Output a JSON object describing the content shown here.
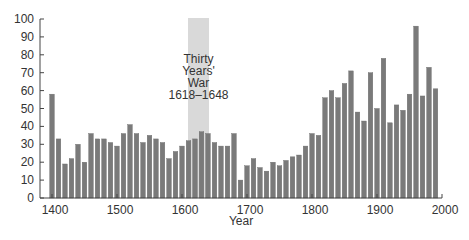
{
  "chart_data": {
    "type": "bar",
    "title": "",
    "xlabel": "Year",
    "ylabel": "",
    "ylim": [
      0,
      100
    ],
    "xlim": [
      1400,
      2000
    ],
    "grid": false,
    "legend": null,
    "y_ticks": [
      0,
      10,
      20,
      30,
      40,
      50,
      60,
      70,
      80,
      90,
      100
    ],
    "x_ticks": [
      1400,
      1500,
      1600,
      1700,
      1800,
      1900,
      2000
    ],
    "categories": [
      1400,
      1410,
      1420,
      1430,
      1440,
      1450,
      1460,
      1470,
      1480,
      1490,
      1500,
      1510,
      1520,
      1530,
      1540,
      1550,
      1560,
      1570,
      1580,
      1590,
      1600,
      1610,
      1620,
      1630,
      1640,
      1650,
      1660,
      1670,
      1680,
      1690,
      1700,
      1710,
      1720,
      1730,
      1740,
      1750,
      1760,
      1770,
      1780,
      1790,
      1800,
      1810,
      1820,
      1830,
      1840,
      1850,
      1860,
      1870,
      1880,
      1890,
      1900,
      1910,
      1920,
      1930,
      1940,
      1950,
      1960,
      1970,
      1980,
      1990
    ],
    "values": [
      58,
      33,
      19,
      22,
      30,
      20,
      36,
      33,
      33,
      31,
      29,
      36,
      41,
      36,
      31,
      35,
      33,
      31,
      22,
      26,
      29,
      32,
      33,
      37,
      36,
      31,
      29,
      29,
      36,
      10,
      18,
      22,
      17,
      15,
      20,
      18,
      21,
      23,
      24,
      29,
      36,
      35,
      56,
      60,
      56,
      64,
      71,
      48,
      43,
      70,
      50,
      78,
      42,
      52,
      49,
      58,
      96,
      57,
      73,
      61
    ],
    "bar_color": "#7a7a7a",
    "annotations": [
      {
        "type": "shaded_span",
        "x_start": 1618,
        "x_end": 1648,
        "color": "#d9d9d9",
        "label_lines": [
          "Thirty",
          "Years'",
          "War",
          "1618–1648"
        ]
      }
    ]
  }
}
